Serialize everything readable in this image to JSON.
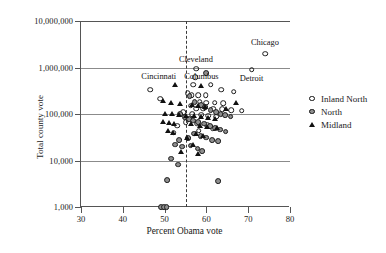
{
  "chart_data": {
    "type": "scatter",
    "title": "",
    "xlabel": "Percent Obama vote",
    "ylabel": "Total county vote",
    "xlim": [
      30,
      80
    ],
    "ylim": [
      1000,
      10000000
    ],
    "yscale": "log",
    "xticks": [
      "30",
      "40",
      "50",
      "60",
      "70",
      "80"
    ],
    "yticks": [
      "1,000",
      "10,000",
      "100,000",
      "1,000,000",
      "10,000,000"
    ],
    "grid": "horizontal gridlines at 10,000 / 100,000 / 1,000,000",
    "legend_position": "right",
    "reference_line": {
      "type": "vertical-dashed",
      "x": 55
    },
    "series": [
      {
        "name": "Inland North",
        "marker": "open-circle",
        "color": "#ffffff",
        "edge": "#1a1a1a",
        "points": [
          [
            74.0,
            2000000
          ],
          [
            70.8,
            900000
          ],
          [
            57.5,
            950000
          ],
          [
            57.3,
            620000
          ],
          [
            56.8,
            430000
          ],
          [
            61.0,
            430000
          ],
          [
            63.5,
            330000
          ],
          [
            66.5,
            300000
          ],
          [
            46.5,
            330000
          ],
          [
            49.0,
            215000
          ],
          [
            55.5,
            280000
          ],
          [
            56.5,
            250000
          ],
          [
            58.0,
            250000
          ],
          [
            59.8,
            250000
          ],
          [
            58.4,
            185000
          ],
          [
            60.0,
            175000
          ],
          [
            62.0,
            175000
          ],
          [
            64.0,
            170000
          ],
          [
            56.2,
            150000
          ],
          [
            57.6,
            130000
          ],
          [
            59.2,
            130000
          ],
          [
            61.6,
            130000
          ],
          [
            63.8,
            125000
          ],
          [
            66.0,
            120000
          ],
          [
            68.4,
            118000
          ],
          [
            54.4,
            108000
          ],
          [
            56.6,
            100000
          ],
          [
            58.8,
            96000
          ],
          [
            60.4,
            92000
          ],
          [
            62.4,
            88000
          ],
          [
            55.0,
            66000
          ],
          [
            57.8,
            62000
          ],
          [
            60.2,
            58000
          ],
          [
            53.0,
            56000
          ],
          [
            61.5,
            48000
          ],
          [
            58.2,
            44000
          ],
          [
            52.2,
            40000
          ]
        ]
      },
      {
        "name": "North",
        "marker": "filled-circle",
        "color": "#8e8e8e",
        "edge": "#1a1a1a",
        "points": [
          [
            60.0,
            760000
          ],
          [
            56.0,
            240000
          ],
          [
            57.2,
            180000
          ],
          [
            58.8,
            155000
          ],
          [
            59.6,
            140000
          ],
          [
            61.0,
            120000
          ],
          [
            62.4,
            112000
          ],
          [
            63.4,
            100000
          ],
          [
            64.4,
            95000
          ],
          [
            65.8,
            88000
          ],
          [
            53.8,
            98000
          ],
          [
            54.8,
            86000
          ],
          [
            55.8,
            78000
          ],
          [
            56.9,
            72000
          ],
          [
            58.1,
            68000
          ],
          [
            59.4,
            62000
          ],
          [
            60.8,
            56000
          ],
          [
            62.1,
            50000
          ],
          [
            63.2,
            46000
          ],
          [
            64.6,
            42000
          ],
          [
            57.0,
            38000
          ],
          [
            58.6,
            34000
          ],
          [
            60.0,
            31000
          ],
          [
            61.4,
            28000
          ],
          [
            62.8,
            26000
          ],
          [
            55.6,
            30000
          ],
          [
            53.4,
            27000
          ],
          [
            52.6,
            22000
          ],
          [
            54.2,
            20000
          ],
          [
            56.2,
            21000
          ],
          [
            57.9,
            18000
          ],
          [
            59.0,
            16000
          ],
          [
            51.6,
            11000
          ],
          [
            53.2,
            8200
          ],
          [
            50.6,
            3800
          ],
          [
            62.8,
            3600
          ],
          [
            49.2,
            1000
          ],
          [
            49.9,
            1000
          ],
          [
            50.5,
            1000
          ]
        ]
      },
      {
        "name": "Midland",
        "marker": "filled-triangle",
        "color": "#111111",
        "edge": "#111111",
        "points": [
          [
            52.4,
            430000
          ],
          [
            58.8,
            400000
          ],
          [
            67.0,
            175000
          ],
          [
            49.6,
            190000
          ],
          [
            51.6,
            170000
          ],
          [
            53.6,
            165000
          ],
          [
            56.6,
            160000
          ],
          [
            58.0,
            150000
          ],
          [
            59.6,
            140000
          ],
          [
            64.8,
            130000
          ],
          [
            50.2,
            102000
          ],
          [
            51.8,
            98000
          ],
          [
            53.4,
            94000
          ],
          [
            55.2,
            92000
          ],
          [
            57.0,
            90000
          ],
          [
            58.6,
            86000
          ],
          [
            60.4,
            84000
          ],
          [
            62.0,
            80000
          ],
          [
            49.6,
            68000
          ],
          [
            51.0,
            64000
          ],
          [
            52.2,
            60000
          ],
          [
            56.4,
            60000
          ],
          [
            58.4,
            56000
          ],
          [
            60.2,
            52000
          ],
          [
            62.6,
            50000
          ],
          [
            50.8,
            44000
          ],
          [
            52.0,
            40000
          ],
          [
            57.6,
            38000
          ],
          [
            59.2,
            34000
          ],
          [
            55.4,
            30000
          ],
          [
            56.8,
            22000
          ],
          [
            54.0,
            15000
          ],
          [
            58.0,
            13500
          ]
        ]
      }
    ],
    "annotations": [
      {
        "label": "Cleveland",
        "x": 57.5,
        "y": 1450000
      },
      {
        "label": "Chicago",
        "x": 74.0,
        "y": 3300000
      },
      {
        "label": "Detroit",
        "x": 70.8,
        "y": 560000
      },
      {
        "label": "Cincinnati",
        "x": 48.6,
        "y": 640000
      },
      {
        "label": "Columbus",
        "x": 58.8,
        "y": 640000
      }
    ]
  },
  "legend": {
    "items": [
      {
        "label": "Inland North",
        "marker": "open-circle"
      },
      {
        "label": "North",
        "marker": "filled-circle"
      },
      {
        "label": "Midland",
        "marker": "filled-triangle"
      }
    ]
  }
}
